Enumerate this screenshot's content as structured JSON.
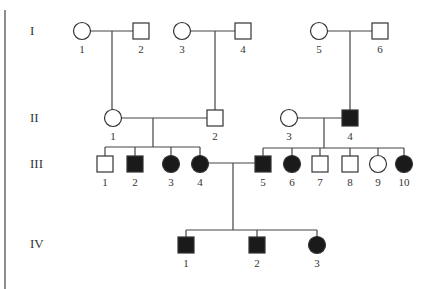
{
  "pedigree": {
    "colors": {
      "affected": "#1a1a1a",
      "unaffected": "#ffffff",
      "line": "#444444"
    },
    "symbol_size": 16,
    "generations": [
      {
        "label": "I",
        "y": 31
      },
      {
        "label": "II",
        "y": 118
      },
      {
        "label": "III",
        "y": 164
      },
      {
        "label": "IV",
        "y": 244
      }
    ],
    "individuals": [
      {
        "id": "I-1",
        "num": "1",
        "sex": "female",
        "affected": false,
        "x": 82,
        "y": 31
      },
      {
        "id": "I-2",
        "num": "2",
        "sex": "male",
        "affected": false,
        "x": 141,
        "y": 31
      },
      {
        "id": "I-3",
        "num": "3",
        "sex": "female",
        "affected": false,
        "x": 182,
        "y": 31
      },
      {
        "id": "I-4",
        "num": "4",
        "sex": "male",
        "affected": false,
        "x": 243,
        "y": 31
      },
      {
        "id": "I-5",
        "num": "5",
        "sex": "female",
        "affected": false,
        "x": 319,
        "y": 31
      },
      {
        "id": "I-6",
        "num": "6",
        "sex": "male",
        "affected": false,
        "x": 380,
        "y": 31
      },
      {
        "id": "II-1",
        "num": "1",
        "sex": "female",
        "affected": false,
        "x": 113,
        "y": 118
      },
      {
        "id": "II-2",
        "num": "2",
        "sex": "male",
        "affected": false,
        "x": 215,
        "y": 118
      },
      {
        "id": "II-3",
        "num": "3",
        "sex": "female",
        "affected": false,
        "x": 289,
        "y": 118
      },
      {
        "id": "II-4",
        "num": "4",
        "sex": "male",
        "affected": true,
        "x": 350,
        "y": 118
      },
      {
        "id": "III-1",
        "num": "1",
        "sex": "male",
        "affected": false,
        "x": 105,
        "y": 164
      },
      {
        "id": "III-2",
        "num": "2",
        "sex": "male",
        "affected": true,
        "x": 135,
        "y": 164
      },
      {
        "id": "III-3",
        "num": "3",
        "sex": "female",
        "affected": true,
        "x": 171,
        "y": 164
      },
      {
        "id": "III-4",
        "num": "4",
        "sex": "female",
        "affected": true,
        "x": 200,
        "y": 164
      },
      {
        "id": "III-5",
        "num": "5",
        "sex": "male",
        "affected": true,
        "x": 263,
        "y": 164
      },
      {
        "id": "III-6",
        "num": "6",
        "sex": "female",
        "affected": true,
        "x": 292,
        "y": 164
      },
      {
        "id": "III-7",
        "num": "7",
        "sex": "male",
        "affected": false,
        "x": 320,
        "y": 164
      },
      {
        "id": "III-8",
        "num": "8",
        "sex": "male",
        "affected": false,
        "x": 350,
        "y": 164
      },
      {
        "id": "III-9",
        "num": "9",
        "sex": "female",
        "affected": false,
        "x": 378,
        "y": 164
      },
      {
        "id": "III-10",
        "num": "10",
        "sex": "female",
        "affected": true,
        "x": 404,
        "y": 164
      },
      {
        "id": "IV-1",
        "num": "1",
        "sex": "male",
        "affected": true,
        "x": 186,
        "y": 245
      },
      {
        "id": "IV-2",
        "num": "2",
        "sex": "male",
        "affected": true,
        "x": 257,
        "y": 245
      },
      {
        "id": "IV-3",
        "num": "3",
        "sex": "female",
        "affected": true,
        "x": 317,
        "y": 245
      }
    ],
    "lines": [
      {
        "name": "left-border-line",
        "x1": 5,
        "y1": 10,
        "x2": 5,
        "y2": 289
      },
      {
        "name": "marriage-I1-I2",
        "x1": 90,
        "y1": 31,
        "x2": 133,
        "y2": 31
      },
      {
        "name": "descent-I1-I2",
        "x1": 112,
        "y1": 31,
        "x2": 112,
        "y2": 110
      },
      {
        "name": "marriage-I3-I4",
        "x1": 190,
        "y1": 31,
        "x2": 235,
        "y2": 31
      },
      {
        "name": "descent-I3-I4",
        "x1": 215,
        "y1": 31,
        "x2": 215,
        "y2": 110
      },
      {
        "name": "marriage-I5-I6",
        "x1": 327,
        "y1": 31,
        "x2": 372,
        "y2": 31
      },
      {
        "name": "descent-I5-I6",
        "x1": 350,
        "y1": 31,
        "x2": 350,
        "y2": 110
      },
      {
        "name": "marriage-II1-II2",
        "x1": 121,
        "y1": 118,
        "x2": 207,
        "y2": 118
      },
      {
        "name": "descent-II1-II2",
        "x1": 153,
        "y1": 118,
        "x2": 153,
        "y2": 147
      },
      {
        "name": "sibship-III1-4",
        "x1": 105,
        "y1": 147,
        "x2": 200,
        "y2": 147
      },
      {
        "name": "drop-III1",
        "x1": 105,
        "y1": 147,
        "x2": 105,
        "y2": 156
      },
      {
        "name": "drop-III2",
        "x1": 135,
        "y1": 147,
        "x2": 135,
        "y2": 156
      },
      {
        "name": "drop-III3",
        "x1": 171,
        "y1": 147,
        "x2": 171,
        "y2": 156
      },
      {
        "name": "drop-III4",
        "x1": 200,
        "y1": 147,
        "x2": 200,
        "y2": 156
      },
      {
        "name": "marriage-II3-II4",
        "x1": 297,
        "y1": 118,
        "x2": 342,
        "y2": 118
      },
      {
        "name": "descent-II3-II4",
        "x1": 324,
        "y1": 118,
        "x2": 324,
        "y2": 148
      },
      {
        "name": "sibship-III5-10",
        "x1": 263,
        "y1": 148,
        "x2": 404,
        "y2": 148
      },
      {
        "name": "drop-III5",
        "x1": 263,
        "y1": 148,
        "x2": 263,
        "y2": 156
      },
      {
        "name": "drop-III6",
        "x1": 292,
        "y1": 148,
        "x2": 292,
        "y2": 156
      },
      {
        "name": "drop-III7",
        "x1": 320,
        "y1": 148,
        "x2": 320,
        "y2": 156
      },
      {
        "name": "drop-III8",
        "x1": 350,
        "y1": 148,
        "x2": 350,
        "y2": 156
      },
      {
        "name": "drop-III9",
        "x1": 378,
        "y1": 148,
        "x2": 378,
        "y2": 156
      },
      {
        "name": "drop-III10",
        "x1": 404,
        "y1": 148,
        "x2": 404,
        "y2": 156
      },
      {
        "name": "marriage-III4-III5",
        "x1": 208,
        "y1": 163,
        "x2": 255,
        "y2": 163
      },
      {
        "name": "descent-III4-III5",
        "x1": 233,
        "y1": 163,
        "x2": 233,
        "y2": 230
      },
      {
        "name": "sibship-IV",
        "x1": 186,
        "y1": 230,
        "x2": 317,
        "y2": 230
      },
      {
        "name": "drop-IV1",
        "x1": 186,
        "y1": 230,
        "x2": 186,
        "y2": 237
      },
      {
        "name": "drop-IV2",
        "x1": 257,
        "y1": 230,
        "x2": 257,
        "y2": 237
      },
      {
        "name": "drop-IV3",
        "x1": 317,
        "y1": 230,
        "x2": 317,
        "y2": 237
      }
    ]
  }
}
